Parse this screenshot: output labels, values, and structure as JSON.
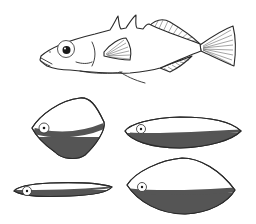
{
  "figure": {
    "illustration": {
      "fish": {
        "label": "stickleback fish",
        "dorsal_spines": 3
      },
      "body_shapes": [
        {
          "id": "deep-rhombic",
          "label": "deep rhombic body shape",
          "shading": "dark lower half"
        },
        {
          "id": "elongate-fusiform",
          "label": "elongate fusiform body shape",
          "shading": "dark lower half"
        },
        {
          "id": "slender-elongate",
          "label": "slender elongate body shape",
          "shading": "dark lower half"
        },
        {
          "id": "deep-fusiform",
          "label": "deep fusiform body shape",
          "shading": "dark lower half"
        }
      ]
    },
    "colors": {
      "line": "#2a2a2a",
      "shading": "#555555",
      "background": "#ffffff"
    }
  }
}
